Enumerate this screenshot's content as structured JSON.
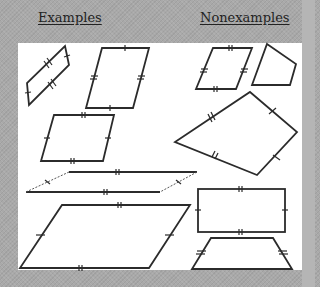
{
  "headings": {
    "examples": "Examples",
    "nonexamples": "Nonexamples"
  },
  "colors": {
    "background": "#a9a9a9",
    "panel": "#ffffff",
    "stroke": "#2b2b2b"
  },
  "diagram": {
    "topic": "Parallelograms",
    "examples": [
      {
        "id": "ex-1",
        "shape": "parallelogram",
        "description": "small tilted parallelogram, opposite sides marked congruent (single and double ticks)"
      },
      {
        "id": "ex-2",
        "shape": "parallelogram",
        "description": "tall slanted parallelogram, single ticks top/bottom, double ticks on sides"
      },
      {
        "id": "ex-3",
        "shape": "parallelogram",
        "description": "medium parallelogram, double ticks top/bottom, single ticks sides"
      },
      {
        "id": "ex-4",
        "shape": "parallelogram",
        "description": "long thin parallelogram, double ticks top/bottom, single ticks on short sides"
      },
      {
        "id": "ex-5",
        "shape": "parallelogram",
        "description": "large parallelogram, double ticks top/bottom, single ticks sides"
      }
    ],
    "nonexamples": [
      {
        "id": "non-1",
        "shape": "quadrilateral",
        "description": "slanted quadrilateral with all sides marked double ticks but not a parallelogram"
      },
      {
        "id": "non-2",
        "shape": "quadrilateral",
        "description": "irregular quadrilateral, no markings"
      },
      {
        "id": "non-3",
        "shape": "kite",
        "description": "kite with adjacent sides congruent (single and double ticks)"
      },
      {
        "id": "non-4",
        "shape": "rectangle",
        "description": "rectangle with tick marks (shown among nonexamples)"
      },
      {
        "id": "non-5",
        "shape": "isosceles-trapezoid",
        "description": "isosceles trapezoid with legs marked congruent"
      }
    ]
  }
}
